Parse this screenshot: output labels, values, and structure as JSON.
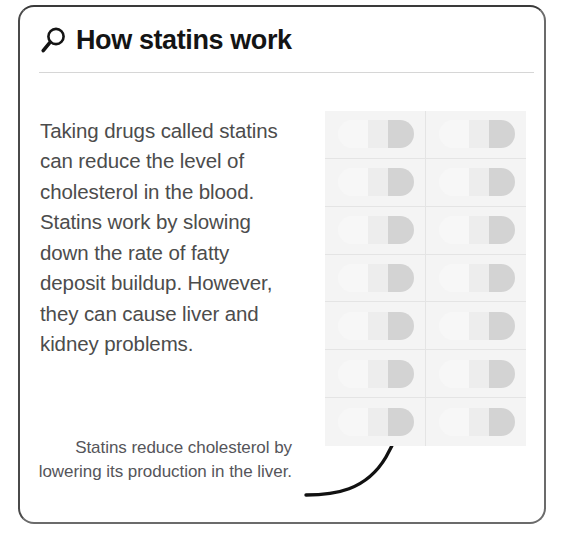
{
  "card": {
    "header": {
      "icon": "search-icon",
      "title": "How statins work"
    },
    "body_paragraph": "Taking drugs called statins can reduce the level of cholesterol in the blood. Statins work by slowing down the rate of fatty deposit buildup. However, they can cause liver and kidney problems.",
    "caption": "Statins reduce cholesterol by lowering its production in the liver.",
    "annotation": {
      "icon": "curved-arrow-icon",
      "points_to": "blister-pack-capsule"
    },
    "illustration": {
      "name": "blister-pack",
      "columns": 2,
      "rows": 7,
      "capsule_count": 14,
      "capsule_label": "capsule-pill"
    }
  },
  "colors": {
    "card_border": "#6b6b6b",
    "title_text": "#141414",
    "body_text": "#4c4c4c",
    "caption_text": "#55555a",
    "divider": "#d6d6d6",
    "pack_background": "#f4f4f4",
    "pack_grid_line": "#e4e4e4",
    "capsule_dark": "#d3d3d3",
    "capsule_light": "#ededed",
    "arrow": "#111111"
  }
}
